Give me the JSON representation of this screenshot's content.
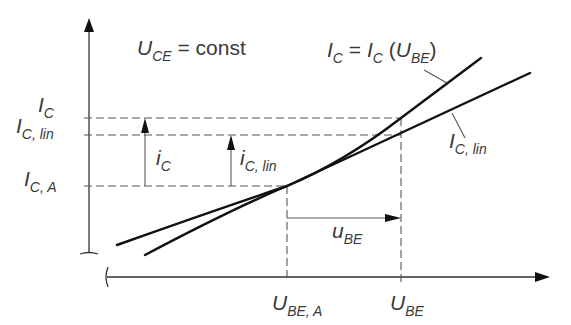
{
  "diagram": {
    "title_condition": {
      "main": "U",
      "sub": "CE",
      "rest": " = const"
    },
    "curve_label": {
      "a": "I",
      "a_sub": "C",
      "eq": " = ",
      "b": "I",
      "b_sub": "C",
      "open": " (",
      "c": "U",
      "c_sub": "BE",
      "close": ")"
    },
    "tangent_label": {
      "main": "I",
      "sub": "C, lin"
    },
    "y_ticks": [
      {
        "main": "I",
        "sub": "C"
      },
      {
        "main": "I",
        "sub": "C, lin"
      },
      {
        "main": "I",
        "sub": "C, A"
      }
    ],
    "x_ticks": [
      {
        "main": "U",
        "sub": "BE, A"
      },
      {
        "main": "U",
        "sub": "BE"
      }
    ],
    "arrows": {
      "ic": {
        "main": "i",
        "sub": "C"
      },
      "ic_lin": {
        "main": "i",
        "sub": "C, lin"
      },
      "ube": {
        "main": "u",
        "sub": "BE"
      }
    },
    "colors": {
      "curve": "#111111",
      "text": "#3a3a3a",
      "dash": "#555555"
    }
  }
}
